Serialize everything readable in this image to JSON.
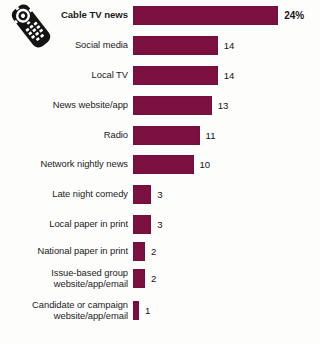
{
  "icon": {
    "name": "tv-remote-control-icon"
  },
  "chart_data": {
    "type": "bar",
    "orientation": "horizontal",
    "title": "",
    "subtitle": "",
    "xlabel": "",
    "ylabel": "",
    "grid": false,
    "legend": null,
    "bar_color": "#7c1141",
    "xlim": [
      0,
      24
    ],
    "categories": [
      "Cable TV news",
      "Social media",
      "Local TV",
      "News website/app",
      "Radio",
      "Network nightly news",
      "Late night comedy",
      "Local paper in print",
      "National paper in print",
      "Issue-based group\nwebsite/app/email",
      "Candidate or campaign\nwebsite/app/email"
    ],
    "values": [
      24,
      14,
      14,
      13,
      11,
      10,
      3,
      3,
      2,
      2,
      1
    ],
    "value_labels": [
      "24%",
      "14",
      "14",
      "13",
      "11",
      "10",
      "3",
      "3",
      "2",
      "2",
      "1"
    ],
    "highlight_index": 0
  }
}
